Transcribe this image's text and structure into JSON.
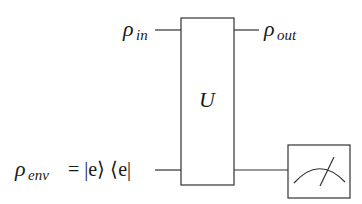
{
  "diagram": {
    "gate_label": "U",
    "inputs": [
      {
        "symbol": "ρ",
        "subscript": "in"
      },
      {
        "symbol": "ρ",
        "subscript": "env",
        "equals": "= |e⟩ ⟨e|"
      }
    ],
    "outputs": [
      {
        "symbol": "ρ",
        "subscript": "out"
      }
    ],
    "measurement": "meter-icon",
    "colors": {
      "line": "#333333",
      "text": "#1a1a1a",
      "background": "#ffffff"
    }
  }
}
